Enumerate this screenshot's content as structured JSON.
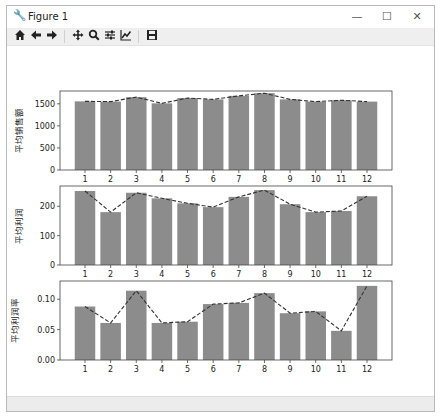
{
  "window": {
    "title": "Figure 1",
    "controls": {
      "minimize": "—",
      "maximize": "☐",
      "close": "✕"
    }
  },
  "toolbar": {
    "buttons": [
      {
        "name": "home",
        "icon": "home-icon",
        "glyph": "⌂"
      },
      {
        "name": "back",
        "icon": "arrow-left-icon",
        "glyph": "←"
      },
      {
        "name": "forward",
        "icon": "arrow-right-icon",
        "glyph": "→"
      },
      {
        "name": "pan",
        "icon": "move-icon",
        "glyph": "✥"
      },
      {
        "name": "zoom",
        "icon": "zoom-icon",
        "glyph": "⌕"
      },
      {
        "name": "subplots",
        "icon": "sliders-icon",
        "glyph": "☰"
      },
      {
        "name": "edit-axis",
        "icon": "line-chart-icon",
        "glyph": "⟋"
      },
      {
        "name": "save",
        "icon": "save-icon",
        "glyph": "▣"
      }
    ]
  },
  "colors": {
    "bar": "#8c8c8c",
    "line": "#333333",
    "axis": "#444444"
  },
  "chart_data": [
    {
      "type": "bar",
      "title": "",
      "xlabel": "",
      "ylabel": "平均销售额",
      "categories": [
        "1",
        "2",
        "3",
        "4",
        "5",
        "6",
        "7",
        "8",
        "9",
        "10",
        "11",
        "12"
      ],
      "values": [
        1555,
        1550,
        1650,
        1510,
        1630,
        1600,
        1680,
        1740,
        1600,
        1550,
        1580,
        1550
      ],
      "overlay_line": "dashed line through bar tops",
      "yticks": [
        "0",
        "500",
        "1000",
        "1500"
      ],
      "ylim": [
        0,
        1790
      ],
      "grid": false
    },
    {
      "type": "bar",
      "title": "",
      "xlabel": "",
      "ylabel": "平均利润",
      "categories": [
        "1",
        "2",
        "3",
        "4",
        "5",
        "6",
        "7",
        "8",
        "9",
        "10",
        "11",
        "12"
      ],
      "values": [
        252,
        180,
        246,
        227,
        210,
        197,
        232,
        255,
        207,
        180,
        184,
        234
      ],
      "overlay_line": "dashed line through bar tops",
      "yticks": [
        "0",
        "100",
        "200"
      ],
      "ylim": [
        0,
        269
      ],
      "grid": false
    },
    {
      "type": "bar",
      "title": "",
      "xlabel": "",
      "ylabel": "平均利润率",
      "categories": [
        "1",
        "2",
        "3",
        "4",
        "5",
        "6",
        "7",
        "8",
        "9",
        "10",
        "11",
        "12"
      ],
      "values": [
        0.088,
        0.061,
        0.114,
        0.061,
        0.063,
        0.092,
        0.094,
        0.11,
        0.077,
        0.08,
        0.048,
        0.122
      ],
      "overlay_line": "dashed line through bar tops",
      "yticks": [
        "0.00",
        "0.05",
        "0.10"
      ],
      "ylim": [
        0,
        0.13
      ],
      "grid": false
    }
  ]
}
